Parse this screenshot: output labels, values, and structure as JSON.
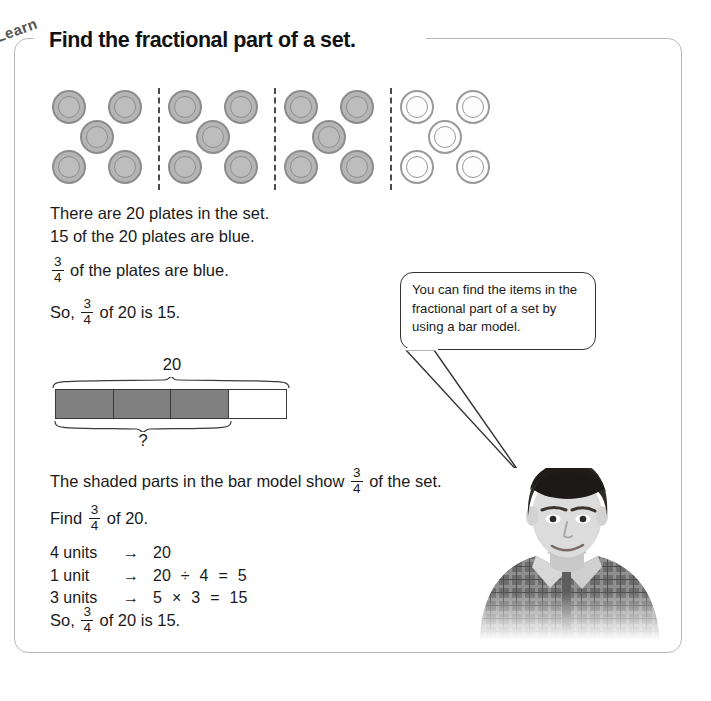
{
  "page": {
    "tag_label": "Learn",
    "heading": "Find the fractional part of a set."
  },
  "plates_diagram": {
    "total_plates": 20,
    "groups": 4,
    "plates_per_group": 5,
    "shaded_groups": 3,
    "shaded_plate_color": "#b5b5b5",
    "unshaded_plate_color": "#fdfdfd",
    "divider_style": "dashed"
  },
  "statements": {
    "line1": "There are 20 plates in the set.",
    "line2": "15 of the 20 plates are blue.",
    "line3_prefix": "",
    "line3_suffix": "of the plates are blue.",
    "line4_prefix": "So,",
    "line4_suffix": "of 20 is 15.",
    "shaded_prefix": "The shaded parts in the bar model show",
    "shaded_suffix": "of the set.",
    "find_prefix": "Find",
    "find_suffix": "of 20.",
    "final_prefix": "So,",
    "final_suffix": "of 20 is 15."
  },
  "fraction": {
    "numerator": "3",
    "denominator": "4"
  },
  "bubble": {
    "text": "You can find the items in the fractional part of a set by using a bar model."
  },
  "bar_model": {
    "top_label": "20",
    "bottom_label": "?",
    "units": 4,
    "shaded_units": 3,
    "shaded_color": "#808080",
    "unshaded_color": "#ffffff"
  },
  "equations": [
    {
      "units": "4 units",
      "arrow": "→",
      "rhs": [
        "20"
      ]
    },
    {
      "units": "1 unit",
      "arrow": "→",
      "rhs": [
        "20",
        "÷",
        "4",
        "=",
        "5"
      ]
    },
    {
      "units": "3 units",
      "arrow": "→",
      "rhs": [
        "5",
        "×",
        "3",
        "=",
        "15"
      ]
    }
  ],
  "photo": {
    "alt": "photo of a boy in a plaid shirt"
  },
  "colors": {
    "frame_border": "#b9b9b9",
    "text": "#1a1a1a",
    "bar_shaded": "#808080"
  }
}
